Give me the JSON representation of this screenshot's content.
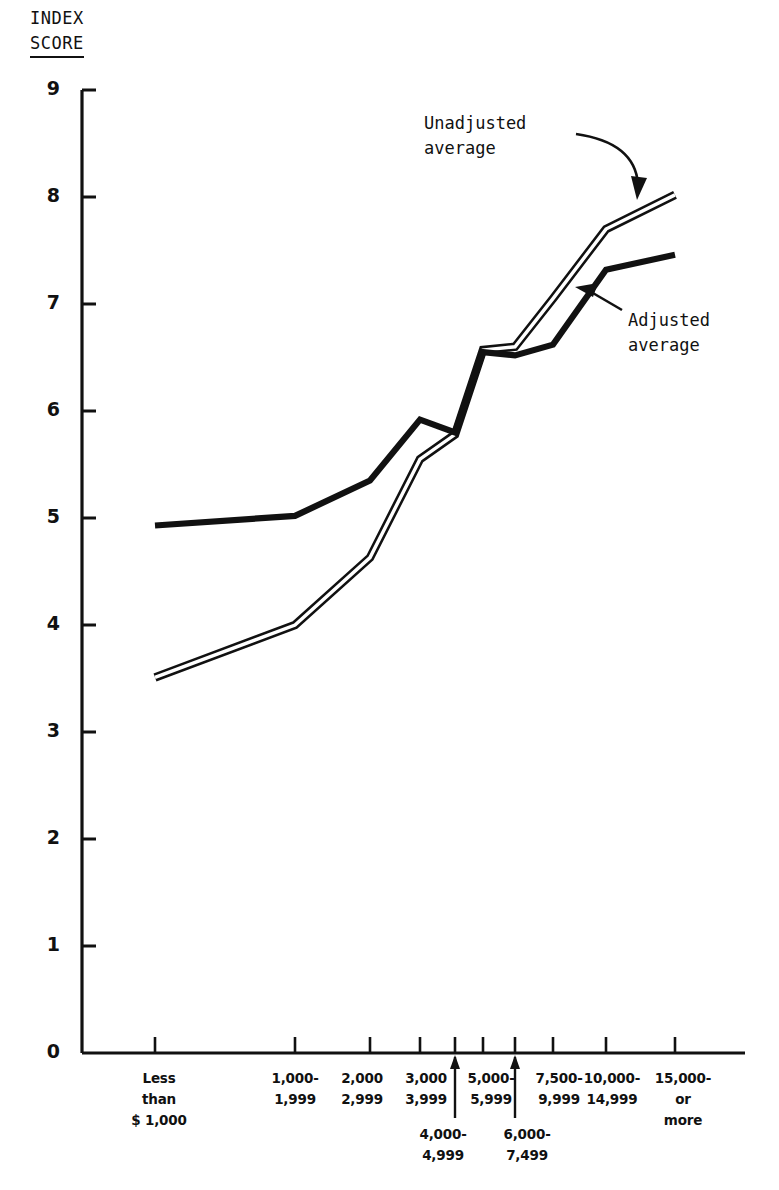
{
  "figure": {
    "axis_title_line1": "INDEX",
    "axis_title_line2": "SCORE"
  },
  "annotations": {
    "unadjusted": "Unadjusted\naverage",
    "adjusted": "Adjusted\naverage"
  },
  "chart_data": {
    "type": "line",
    "xlabel": "",
    "ylabel": "INDEX SCORE",
    "ylim": [
      0,
      9
    ],
    "yticks": [
      "0",
      "1",
      "2",
      "3",
      "4",
      "5",
      "6",
      "7",
      "8",
      "9"
    ],
    "grid": false,
    "legend_position": "inline-annotations",
    "categories": [
      "Less than $ 1,000",
      "1,000-1,999",
      "2,000-2,999",
      "3,000-3,999",
      "4,000-4,999",
      "5,000-5,999",
      "6,000-7,499",
      "7,500-9,999",
      "10,000-14,999",
      "15,000 or more"
    ],
    "category_labels": [
      {
        "l1": "Less",
        "l2": "than",
        "l3": "$ 1,000",
        "tier": 1
      },
      {
        "l1": "1,000-",
        "l2": "1,999",
        "l3": "",
        "tier": 1
      },
      {
        "l1": "2,000",
        "l2": "2,999",
        "l3": "",
        "tier": 1
      },
      {
        "l1": "3,000",
        "l2": "3,999",
        "l3": "",
        "tier": 1
      },
      {
        "l1": "4,000-",
        "l2": "4,999",
        "l3": "",
        "tier": 2
      },
      {
        "l1": "5,000-",
        "l2": "5,999",
        "l3": "",
        "tier": 1
      },
      {
        "l1": "6,000-",
        "l2": "7,499",
        "l3": "",
        "tier": 2
      },
      {
        "l1": "7,500-",
        "l2": "9,999",
        "l3": "",
        "tier": 1
      },
      {
        "l1": "10,000-",
        "l2": "14,999",
        "l3": "",
        "tier": 1
      },
      {
        "l1": "15,000-",
        "l2": "or",
        "l3": "more",
        "tier": 1
      }
    ],
    "series": [
      {
        "name": "Unadjusted average",
        "style": "double-line",
        "values": [
          3.51,
          4.0,
          4.63,
          5.55,
          5.78,
          6.57,
          6.6,
          7.05,
          7.7,
          8.02
        ]
      },
      {
        "name": "Adjusted average",
        "style": "solid-thick",
        "values": [
          4.93,
          5.02,
          5.35,
          5.92,
          5.8,
          6.55,
          6.52,
          6.62,
          7.32,
          7.46
        ]
      }
    ]
  },
  "geometry": {
    "plot_left": 82,
    "plot_baseline_y": 1053,
    "plot_top_y": 90,
    "tick_x": [
      155,
      295,
      370,
      420,
      455,
      483,
      515,
      553,
      606,
      675
    ]
  }
}
